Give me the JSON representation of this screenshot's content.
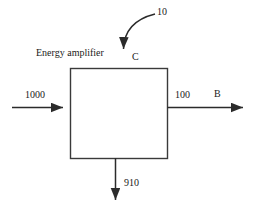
{
  "diagram": {
    "title": "Energy amplifier",
    "stroke_color": "#3a3a3a",
    "background_color": "#ffffff",
    "block": {
      "label": "Energy amplifier"
    },
    "flows": [
      {
        "name": "input-main",
        "value": "1000",
        "direction": "right",
        "position": "left"
      },
      {
        "name": "input-top",
        "value": "10",
        "stream_label": "C",
        "direction": "down",
        "position": "top"
      },
      {
        "name": "output-right",
        "value": "100",
        "stream_label": "B",
        "direction": "right",
        "position": "right"
      },
      {
        "name": "output-bottom",
        "value": "910",
        "direction": "down",
        "position": "bottom"
      }
    ],
    "labels": {
      "input_main_value": "1000",
      "input_top_value": "10",
      "output_right_value": "100",
      "output_bottom_value": "910",
      "stream_c": "C",
      "stream_b": "B"
    }
  }
}
